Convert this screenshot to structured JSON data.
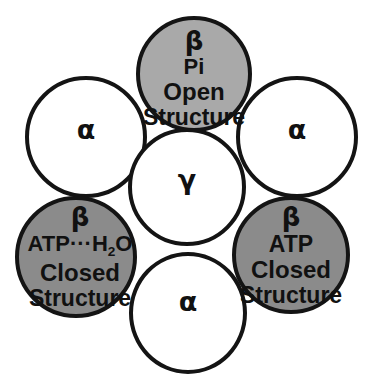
{
  "figure": {
    "colors": {
      "outline": "#141414",
      "alpha_fill": "#ffffff",
      "gamma_fill": "#ffffff",
      "beta_open_fill": "#a9a9a9",
      "beta_closed_fill": "#8b8b8b",
      "text": "#111111",
      "background": "#ffffff"
    }
  },
  "subunits": {
    "beta_top": {
      "name": "β",
      "ligand": "Pi",
      "state": "Open",
      "state_word": "Structure"
    },
    "beta_left": {
      "name": "β",
      "ligand_prefix": "ATP",
      "ligand_bond": "···",
      "ligand_suffix_main": "H",
      "ligand_suffix_sub": "2",
      "ligand_suffix_tail": "O",
      "state": "Closed",
      "state_word": "Structure"
    },
    "beta_right": {
      "name": "β",
      "ligand": "ATP",
      "state": "Closed",
      "state_word": "Structure"
    },
    "alpha_left": {
      "name": "α"
    },
    "alpha_right": {
      "name": "α"
    },
    "alpha_bottom": {
      "name": "α"
    },
    "gamma_center": {
      "name": "γ"
    }
  }
}
